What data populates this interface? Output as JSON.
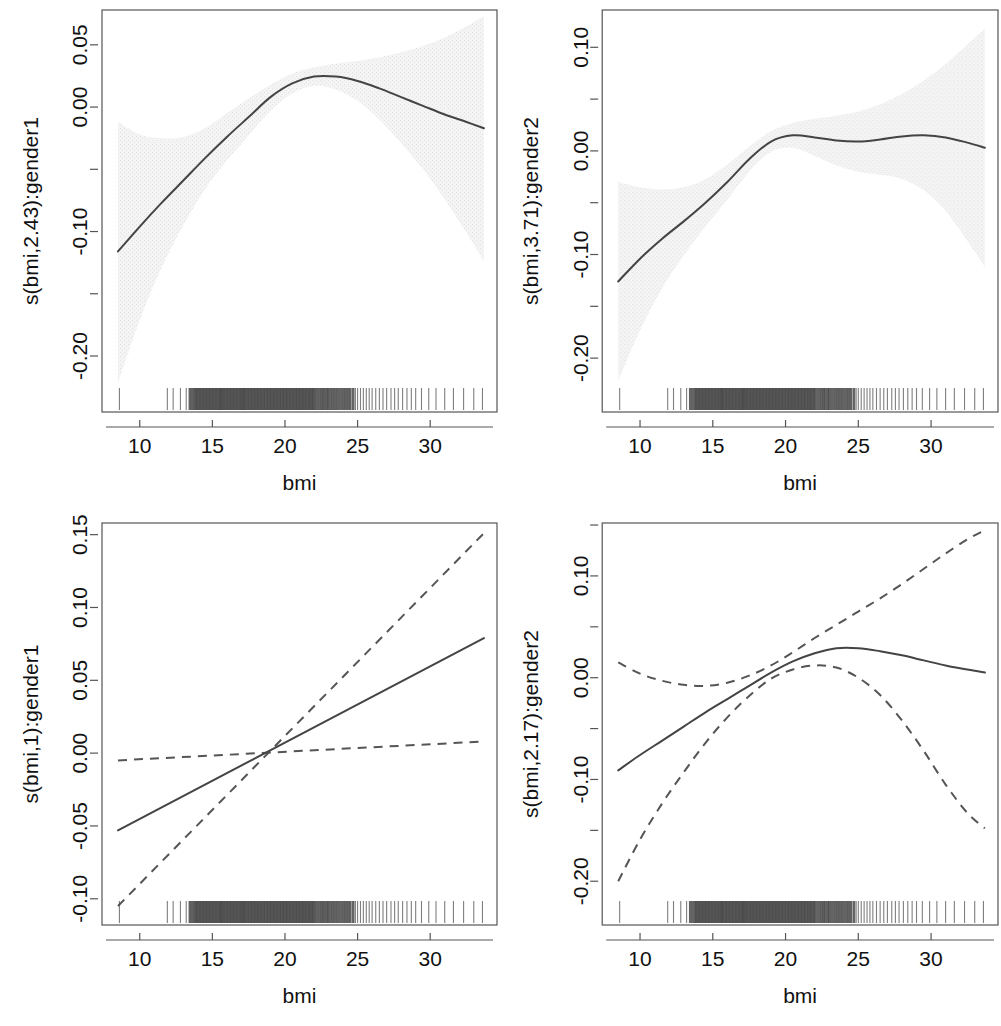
{
  "figure": {
    "layout": "2x2 panel grid of GAM smooth term plots",
    "background_color": "#ffffff",
    "line_color": "#444444",
    "ci_band_color": "#efefef",
    "rug_color": "#4a4a4a"
  },
  "chart_data": [
    {
      "type": "line",
      "panel": "top-left",
      "title": "",
      "xlabel": "bmi",
      "ylabel": "s(bmi,2.43):gender1",
      "xlim": [
        7.4,
        34.6
      ],
      "ylim": [
        -0.245,
        0.078
      ],
      "xticks": [
        10,
        15,
        20,
        25,
        30
      ],
      "xtick_labels": [
        "10",
        "15",
        "20",
        "25",
        "30"
      ],
      "yticks": [
        0.05,
        0.0,
        -0.05,
        -0.1,
        -0.15,
        -0.2
      ],
      "ytick_labels": [
        "0.05",
        "0.00",
        "",
        "-0.10",
        "",
        "-0.20"
      ],
      "grid": false,
      "legend": "none",
      "ci_style": "shaded",
      "x": [
        8.5,
        10,
        11.5,
        13,
        14.5,
        16,
        17.5,
        19,
        20.5,
        22,
        23.5,
        25,
        26.5,
        28,
        29.5,
        31,
        32.5,
        33.7
      ],
      "fit": [
        -0.116,
        -0.096,
        -0.077,
        -0.059,
        -0.041,
        -0.024,
        -0.008,
        0.008,
        0.019,
        0.0245,
        0.0245,
        0.021,
        0.015,
        0.008,
        0.001,
        -0.006,
        -0.012,
        -0.017
      ],
      "ci_upper": [
        -0.012,
        -0.022,
        -0.025,
        -0.024,
        -0.017,
        -0.005,
        0.007,
        0.018,
        0.027,
        0.032,
        0.035,
        0.037,
        0.04,
        0.044,
        0.049,
        0.056,
        0.065,
        0.073
      ],
      "ci_lower": [
        -0.222,
        -0.171,
        -0.129,
        -0.095,
        -0.066,
        -0.043,
        -0.023,
        -0.003,
        0.011,
        0.017,
        0.014,
        0.005,
        -0.01,
        -0.029,
        -0.05,
        -0.074,
        -0.101,
        -0.124
      ],
      "rug": true
    },
    {
      "type": "line",
      "panel": "top-right",
      "title": "",
      "xlabel": "bmi",
      "ylabel": "s(bmi,3.71):gender2",
      "xlim": [
        7.4,
        34.6
      ],
      "ylim": [
        -0.252,
        0.136
      ],
      "xticks": [
        10,
        15,
        20,
        25,
        30
      ],
      "xtick_labels": [
        "10",
        "15",
        "20",
        "25",
        "30"
      ],
      "yticks": [
        0.1,
        0.05,
        0.0,
        -0.05,
        -0.1,
        -0.15,
        -0.2
      ],
      "ytick_labels": [
        "0.10",
        "",
        "0.00",
        "",
        "-0.10",
        "",
        "-0.20"
      ],
      "grid": false,
      "legend": "none",
      "ci_style": "shaded",
      "x": [
        8.5,
        10,
        11.5,
        13,
        14.5,
        16,
        17.5,
        19,
        20.5,
        22,
        23.5,
        25,
        26.5,
        28,
        29.5,
        31,
        32.5,
        33.7
      ],
      "fit": [
        -0.126,
        -0.104,
        -0.085,
        -0.068,
        -0.05,
        -0.03,
        -0.008,
        0.009,
        0.015,
        0.013,
        0.01,
        0.009,
        0.011,
        0.014,
        0.015,
        0.013,
        0.008,
        0.003
      ],
      "ci_upper": [
        -0.03,
        -0.035,
        -0.037,
        -0.035,
        -0.027,
        -0.013,
        0.004,
        0.019,
        0.027,
        0.031,
        0.034,
        0.038,
        0.045,
        0.055,
        0.068,
        0.084,
        0.103,
        0.118
      ],
      "ci_lower": [
        -0.222,
        -0.173,
        -0.133,
        -0.101,
        -0.073,
        -0.047,
        -0.02,
        -0.001,
        0.003,
        -0.005,
        -0.014,
        -0.02,
        -0.023,
        -0.027,
        -0.038,
        -0.058,
        -0.087,
        -0.112
      ],
      "rug": true
    },
    {
      "type": "line",
      "panel": "bottom-left",
      "title": "",
      "xlabel": "bmi",
      "ylabel": "s(bmi,1):gender1",
      "xlim": [
        7.4,
        34.6
      ],
      "ylim": [
        -0.118,
        0.158
      ],
      "xticks": [
        10,
        15,
        20,
        25,
        30
      ],
      "xtick_labels": [
        "10",
        "15",
        "20",
        "25",
        "30"
      ],
      "yticks": [
        0.15,
        0.1,
        0.05,
        0.0,
        -0.05,
        -0.1
      ],
      "ytick_labels": [
        "0.15",
        "0.10",
        "0.05",
        "0.00",
        "-0.05",
        "-0.10"
      ],
      "grid": false,
      "legend": "none",
      "ci_style": "dashed",
      "x": [
        8.5,
        33.7
      ],
      "fit": [
        -0.053,
        0.079
      ],
      "ci_upper": [
        -0.005,
        0.008
      ],
      "ci_lower": [
        -0.105,
        0.151
      ],
      "rug": true
    },
    {
      "type": "line",
      "panel": "bottom-right",
      "title": "",
      "xlabel": "bmi",
      "ylabel": "s(bmi,2.17):gender2",
      "xlim": [
        7.4,
        34.6
      ],
      "ylim": [
        -0.243,
        0.152
      ],
      "xticks": [
        10,
        15,
        20,
        25,
        30
      ],
      "xtick_labels": [
        "10",
        "15",
        "20",
        "25",
        "30"
      ],
      "yticks": [
        0.15,
        0.1,
        0.05,
        0.0,
        -0.05,
        -0.1,
        -0.15,
        -0.2
      ],
      "ytick_labels": [
        "",
        "0.10",
        "",
        "0.00",
        "",
        "-0.10",
        "",
        "-0.20"
      ],
      "grid": false,
      "legend": "none",
      "ci_style": "dashed",
      "x": [
        8.5,
        10,
        11.5,
        13,
        14.5,
        16,
        17.5,
        19,
        20.5,
        22,
        23.5,
        25,
        26.5,
        28,
        29.5,
        31,
        32.5,
        33.7
      ],
      "fit": [
        -0.091,
        -0.076,
        -0.062,
        -0.048,
        -0.034,
        -0.021,
        -0.008,
        0.005,
        0.016,
        0.024,
        0.029,
        0.029,
        0.026,
        0.022,
        0.017,
        0.012,
        0.008,
        0.005
      ],
      "ci_upper": [
        0.015,
        0.004,
        -0.003,
        -0.007,
        -0.008,
        -0.005,
        0.002,
        0.012,
        0.025,
        0.039,
        0.052,
        0.065,
        0.078,
        0.092,
        0.107,
        0.122,
        0.136,
        0.145
      ],
      "ci_lower": [
        -0.2,
        -0.159,
        -0.124,
        -0.093,
        -0.064,
        -0.039,
        -0.018,
        -0.001,
        0.008,
        0.012,
        0.01,
        0.0,
        -0.017,
        -0.042,
        -0.072,
        -0.105,
        -0.133,
        -0.148
      ],
      "rug": true
    }
  ],
  "rug_values": [
    8.6,
    11.9,
    12.3,
    12.8,
    13.2,
    13.45,
    13.6,
    13.75,
    13.85,
    13.95,
    14.05,
    14.15,
    14.25,
    14.35,
    14.45,
    14.55,
    14.65,
    14.75,
    14.85,
    14.95,
    15.05,
    15.15,
    15.25,
    15.35,
    15.45,
    15.55,
    15.62,
    15.7,
    15.8,
    15.9,
    16.0,
    16.1,
    16.2,
    16.3,
    16.4,
    16.5,
    16.6,
    16.7,
    16.8,
    16.9,
    17.0,
    17.08,
    17.16,
    17.25,
    17.35,
    17.45,
    17.55,
    17.65,
    17.75,
    17.85,
    17.95,
    18.05,
    18.15,
    18.25,
    18.35,
    18.45,
    18.55,
    18.65,
    18.75,
    18.85,
    18.95,
    19.05,
    19.15,
    19.25,
    19.35,
    19.45,
    19.55,
    19.65,
    19.75,
    19.85,
    19.95,
    20.05,
    20.15,
    20.25,
    20.35,
    20.45,
    20.55,
    20.65,
    20.75,
    20.85,
    20.95,
    21.05,
    21.15,
    21.25,
    21.35,
    21.45,
    21.55,
    21.65,
    21.75,
    21.85,
    21.95,
    22.05,
    22.2,
    22.35,
    22.5,
    22.62,
    22.75,
    22.9,
    23.0,
    23.15,
    23.3,
    23.45,
    23.6,
    23.75,
    23.9,
    24.05,
    24.2,
    24.35,
    24.5,
    24.7,
    24.85,
    25.0,
    25.2,
    25.4,
    25.6,
    25.8,
    26.0,
    26.25,
    26.5,
    26.75,
    27.0,
    27.3,
    27.55,
    27.8,
    28.1,
    28.4,
    28.7,
    29.0,
    29.4,
    29.9,
    30.4,
    31.0,
    31.6,
    32.3,
    33.0,
    33.6
  ],
  "rug_heavy_range": [
    13.4,
    24.8
  ]
}
